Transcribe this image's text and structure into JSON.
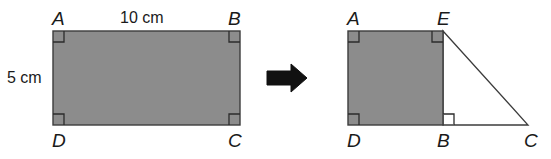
{
  "figure": {
    "colors": {
      "background": "#ffffff",
      "shape_fill": "#8c8c8c",
      "shape_stroke": "#3c3c3c",
      "text": "#1a1a1a",
      "arrow": "#111111"
    },
    "left_figure": {
      "name": "rectangle-abcd",
      "vertices": [
        {
          "label": "A",
          "x": 53,
          "y": 31
        },
        {
          "label": "B",
          "x": 240,
          "y": 31
        },
        {
          "label": "C",
          "x": 240,
          "y": 125
        },
        {
          "label": "D",
          "x": 53,
          "y": 125
        }
      ],
      "labels": {
        "a": "A",
        "b": "B",
        "c": "C",
        "d": "D"
      },
      "measurements": {
        "top": "10 cm",
        "left": "5 cm"
      },
      "right_angle_markers": 4
    },
    "arrow": {
      "name": "transformation-arrow",
      "direction": "right",
      "x": 267,
      "y": 77
    },
    "right_figure": {
      "name": "square-adbe-with-triangle-ebc",
      "vertices": [
        {
          "label": "A",
          "x": 348,
          "y": 31
        },
        {
          "label": "E",
          "x": 443,
          "y": 31
        },
        {
          "label": "B",
          "x": 443,
          "y": 125
        },
        {
          "label": "D",
          "x": 348,
          "y": 125
        },
        {
          "label": "C",
          "x": 528,
          "y": 125
        }
      ],
      "labels": {
        "a": "A",
        "e": "E",
        "b": "B",
        "c": "C",
        "d": "D"
      },
      "right_angle_markers": 4
    }
  }
}
